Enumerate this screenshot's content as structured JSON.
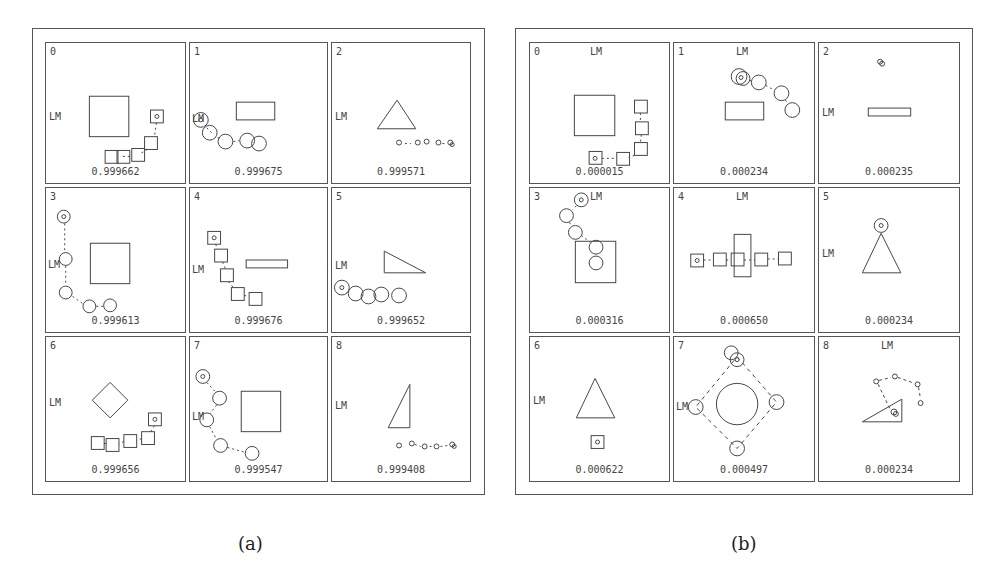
{
  "figures": [
    {
      "caption": "(a)",
      "cells": [
        {
          "index": "0",
          "score": "0.999662",
          "lm_label": "LM"
        },
        {
          "index": "1",
          "score": "0.999675",
          "lm_label": "LM"
        },
        {
          "index": "2",
          "score": "0.999571",
          "lm_label": "LM"
        },
        {
          "index": "3",
          "score": "0.999613",
          "lm_label": "LM"
        },
        {
          "index": "4",
          "score": "0.999676",
          "lm_label": "LM"
        },
        {
          "index": "5",
          "score": "0.999652",
          "lm_label": "LM"
        },
        {
          "index": "6",
          "score": "0.999656",
          "lm_label": "LM"
        },
        {
          "index": "7",
          "score": "0.999547",
          "lm_label": "LM"
        },
        {
          "index": "8",
          "score": "0.999408",
          "lm_label": "LM"
        }
      ]
    },
    {
      "caption": "(b)",
      "cells": [
        {
          "index": "0",
          "score": "0.000015",
          "lm_label": "LM"
        },
        {
          "index": "1",
          "score": "0.000234",
          "lm_label": "LM"
        },
        {
          "index": "2",
          "score": "0.000235",
          "lm_label": "LM"
        },
        {
          "index": "3",
          "score": "0.000316",
          "lm_label": "LM"
        },
        {
          "index": "4",
          "score": "0.000650",
          "lm_label": "LM"
        },
        {
          "index": "5",
          "score": "0.000234",
          "lm_label": "LM"
        },
        {
          "index": "6",
          "score": "0.000622",
          "lm_label": "LM"
        },
        {
          "index": "7",
          "score": "0.000497",
          "lm_label": "LM"
        },
        {
          "index": "8",
          "score": "0.000234",
          "lm_label": "LM"
        }
      ]
    }
  ]
}
